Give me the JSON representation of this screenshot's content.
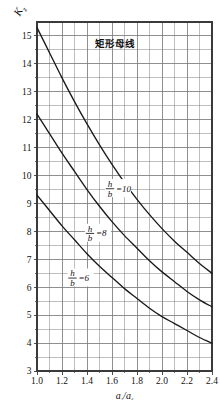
{
  "chart_data": {
    "type": "line",
    "title": "矩形母线",
    "xlabel": "a₁/a₂",
    "ylabel": "K₂",
    "ylabel_base": "K",
    "ylabel_sub": "z",
    "xlim": [
      1.0,
      2.4
    ],
    "ylim": [
      3,
      15.5
    ],
    "grid": true,
    "legend_position": "inline-on-curve",
    "x_major_step": 0.2,
    "x_minor_step": 0.1,
    "y_major_step": 1,
    "y_minor_step": 0.5,
    "xticks": [
      "1.0",
      "1.2",
      "1.4",
      "1.6",
      "1.8",
      "2.0",
      "2.2",
      "2.4"
    ],
    "xtick_values": [
      1.0,
      1.2,
      1.4,
      1.6,
      1.8,
      2.0,
      2.2,
      2.4
    ],
    "yticks": [
      "3",
      "4",
      "5",
      "6",
      "7",
      "8",
      "9",
      "10",
      "11",
      "12",
      "13",
      "14",
      "15"
    ],
    "ytick_values": [
      3,
      4,
      5,
      6,
      7,
      8,
      9,
      10,
      11,
      12,
      13,
      14,
      15
    ],
    "x": [
      1.0,
      1.1,
      1.2,
      1.3,
      1.4,
      1.5,
      1.6,
      1.7,
      1.8,
      1.9,
      2.0,
      2.1,
      2.2,
      2.3,
      2.4
    ],
    "series": [
      {
        "name": "h/b =10",
        "label_numerator": "h",
        "label_denominator": "b",
        "label_value": "=10",
        "values": [
          15.3,
          14.4,
          13.5,
          12.65,
          11.85,
          11.1,
          10.4,
          9.75,
          9.15,
          8.6,
          8.1,
          7.65,
          7.25,
          6.85,
          6.5
        ]
      },
      {
        "name": "h/b =8",
        "label_numerator": "h",
        "label_denominator": "b",
        "label_value": "=8",
        "values": [
          12.2,
          11.5,
          10.8,
          10.15,
          9.5,
          8.9,
          8.35,
          7.85,
          7.4,
          6.95,
          6.55,
          6.2,
          5.85,
          5.55,
          5.3
        ]
      },
      {
        "name": "h/b =6",
        "label_numerator": "h",
        "label_denominator": "b",
        "label_value": "=6",
        "values": [
          9.3,
          8.75,
          8.2,
          7.7,
          7.2,
          6.75,
          6.35,
          5.95,
          5.6,
          5.25,
          4.95,
          4.7,
          4.45,
          4.2,
          4.0
        ]
      }
    ],
    "annotations": [
      {
        "text": "矩形母线",
        "x": 1.62,
        "y": 14.6
      },
      {
        "text": "h/b =10",
        "x": 1.6,
        "y": 9.55
      },
      {
        "text": "h/b =8",
        "x": 1.44,
        "y": 7.95
      },
      {
        "text": "h/b =6",
        "x": 1.3,
        "y": 6.35
      }
    ],
    "colors": {
      "curve": "#1a1a1a",
      "grid": "#7d7d7d",
      "frame": "#3a3a3a",
      "background": "#ffffff",
      "text": "#111111"
    }
  }
}
